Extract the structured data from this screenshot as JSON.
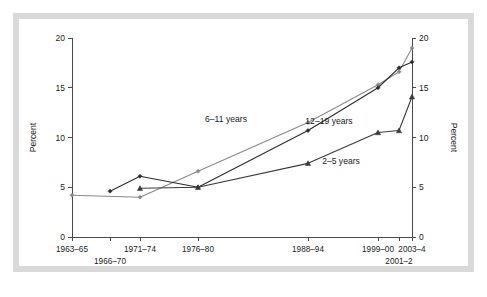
{
  "figure": {
    "frame_color": "#d9d9d9",
    "background_color": "#ffffff"
  },
  "axes": {
    "left_title": "Percent",
    "right_title": "Percent",
    "y_ticks": [
      "0",
      "5",
      "10",
      "15",
      "20"
    ],
    "x_ticks_upper": [
      "1963–65",
      "1971–74",
      "1976–80",
      "1988–94",
      "1999–00",
      "2003–4"
    ],
    "x_ticks_lower": [
      "1966–70",
      "2001–2"
    ]
  },
  "series_labels": {
    "s6_11": "6–11 years",
    "s12_19": "12–19 years",
    "s2_5": "2–5 years"
  },
  "chart_data": {
    "type": "line",
    "title": "",
    "xlabel": "",
    "ylabel": "Percent",
    "ylim": [
      0,
      20
    ],
    "grid": false,
    "legend_position": "inline-annotations",
    "categories": [
      "1963–65",
      "1966–70",
      "1971–74",
      "1976–80",
      "1988–94",
      "1999–00",
      "2001–2",
      "2003–4"
    ],
    "series": [
      {
        "name": "6–11 years",
        "color": "#8a8a8a",
        "marker": "diamond",
        "x": [
          "1963–65",
          "1971–74",
          "1976–80",
          "1988–94",
          "1999–00",
          "2001–2",
          "2003–4"
        ],
        "values": [
          4.2,
          4.0,
          6.6,
          11.5,
          15.3,
          16.6,
          19.0
        ]
      },
      {
        "name": "12–19 years",
        "color": "#2b2b2b",
        "marker": "diamond",
        "x": [
          "1966–70",
          "1971–74",
          "1976–80",
          "1988–94",
          "1999–00",
          "2001–2",
          "2003–4"
        ],
        "values": [
          4.6,
          6.1,
          5.0,
          10.7,
          15.0,
          17.0,
          17.6
        ]
      },
      {
        "name": "2–5 years",
        "color": "#3a3a3a",
        "marker": "triangle",
        "x": [
          "1971–74",
          "1976–80",
          "1988–94",
          "1999–00",
          "2001–2",
          "2003–4"
        ],
        "values": [
          4.9,
          5.0,
          7.4,
          10.5,
          10.7,
          14.1
        ]
      }
    ],
    "annotations": [
      {
        "text": "6–11 years",
        "x_px": 226,
        "y_px": 122
      },
      {
        "text": "12–19 years",
        "x_px": 329,
        "y_px": 124
      },
      {
        "text": "2–5 years",
        "x_px": 341,
        "y_px": 164
      }
    ]
  },
  "geometry": {
    "plot_left_px": 72,
    "plot_right_px": 412,
    "plot_top_px": 38,
    "plot_bottom_px": 237,
    "x_positions": {
      "1963–65": 72,
      "1966–70": 110,
      "1971–74": 140,
      "1976–80": 198,
      "1988–94": 308,
      "1999–00": 378,
      "2001–2": 399,
      "2003–4": 412
    }
  }
}
